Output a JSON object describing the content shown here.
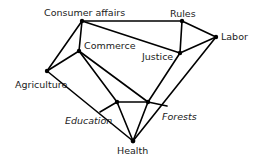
{
  "diagram": {
    "type": "network-graph",
    "nodes": [
      {
        "id": "consumer_affairs",
        "label": "Consumer affairs",
        "x": 82,
        "y": 21
      },
      {
        "id": "commerce",
        "label": "Commerce",
        "x": 79,
        "y": 51
      },
      {
        "id": "agriculture",
        "label": "Agriculture",
        "x": 47,
        "y": 71
      },
      {
        "id": "rules",
        "label": "Rules",
        "x": 182,
        "y": 21
      },
      {
        "id": "labor",
        "label": "Labor",
        "x": 216,
        "y": 37
      },
      {
        "id": "justice",
        "label": "Justice",
        "x": 180,
        "y": 53
      },
      {
        "id": "education",
        "label": "Education",
        "x": 117,
        "y": 102
      },
      {
        "id": "forests",
        "label": "Forests",
        "x": 148,
        "y": 102
      },
      {
        "id": "health",
        "label": "Health",
        "x": 133,
        "y": 141
      }
    ],
    "edges": [
      [
        "consumer_affairs",
        "rules"
      ],
      [
        "consumer_affairs",
        "justice"
      ],
      [
        "consumer_affairs",
        "commerce"
      ],
      [
        "consumer_affairs",
        "agriculture"
      ],
      [
        "commerce",
        "agriculture"
      ],
      [
        "commerce",
        "education"
      ],
      [
        "commerce",
        "forests"
      ],
      [
        "agriculture",
        "health"
      ],
      [
        "rules",
        "justice"
      ],
      [
        "rules",
        "labor"
      ],
      [
        "justice",
        "labor"
      ],
      [
        "justice",
        "forests"
      ],
      [
        "labor",
        "health"
      ],
      [
        "education",
        "forests"
      ],
      [
        "education",
        "health"
      ],
      [
        "forests",
        "health"
      ]
    ],
    "labels": {
      "consumer_affairs": "Consumer affairs",
      "commerce": "Commerce",
      "agriculture": "Agriculture",
      "rules": "Rules",
      "labor": "Labor",
      "justice": "Justice",
      "education": "Education",
      "forests": "Forests",
      "health": "Health"
    }
  }
}
